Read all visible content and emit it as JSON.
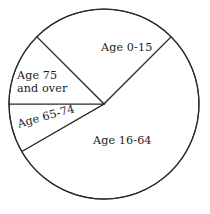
{
  "chart_data": {
    "type": "pie",
    "title": "",
    "subtitle": "",
    "xlabel": "",
    "ylabel": "",
    "grid": false,
    "legend_position": "none",
    "label_placement": "inside-slices",
    "units": "percent of population",
    "categories": [
      "Age 0-15",
      "Age 16-64",
      "Age 65-74",
      "Age 75 and over"
    ],
    "values": [
      25,
      54.2,
      8.3,
      12.5
    ],
    "slices": [
      {
        "label": "Age 0-15",
        "value": 25,
        "angle_degrees": 90,
        "start_angle_degrees": 45,
        "end_angle_degrees": 135,
        "fill": "#ffffff",
        "stroke": "#2b2b2b"
      },
      {
        "label": "Age 16-64",
        "value": 54.2,
        "angle_degrees": 195,
        "start_angle_degrees": 210,
        "end_angle_degrees": 45,
        "fill": "#ffffff",
        "stroke": "#2b2b2b"
      },
      {
        "label": "Age 65-74",
        "value": 8.3,
        "angle_degrees": 30,
        "start_angle_degrees": 180,
        "end_angle_degrees": 210,
        "fill": "#ffffff",
        "stroke": "#2b2b2b"
      },
      {
        "label": "Age 75 and over",
        "value": 12.5,
        "angle_degrees": 45,
        "start_angle_degrees": 135,
        "end_angle_degrees": 180,
        "fill": "#ffffff",
        "stroke": "#2b2b2b"
      }
    ],
    "geometry": {
      "center_x": 104,
      "center_y": 104,
      "radius": 95
    },
    "colors": {
      "background": "#ffffff",
      "outline": "#2b2b2b",
      "text": "#1c1c1c"
    }
  },
  "labels": {
    "age_0_15": "Age 0-15",
    "age_75_line1": "Age 75",
    "age_75_line2": "and over",
    "age_65_74": "Age 65-74",
    "age_16_64": "Age 16-64"
  }
}
